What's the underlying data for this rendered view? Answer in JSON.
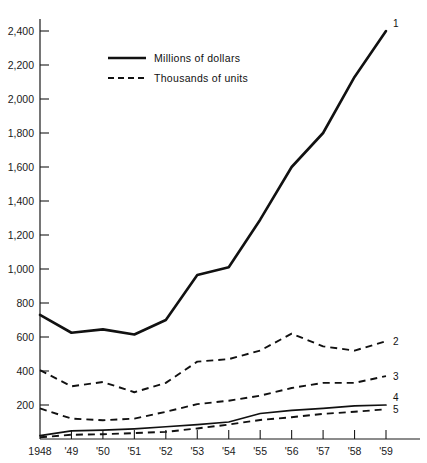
{
  "chart_data": {
    "type": "line",
    "title": "",
    "subtitle": "",
    "xlabel": "",
    "ylabel": "",
    "grid": false,
    "legend_position": "upper-left-inside",
    "xlim": [
      1948,
      1959
    ],
    "ylim": [
      0,
      2400
    ],
    "ytick_step": 200,
    "categories": [
      "1948",
      "'49",
      "'50",
      "'51",
      "'52",
      "'53",
      "'54",
      "'55",
      "'56",
      "'57",
      "'58",
      "'59"
    ],
    "x": [
      1948,
      1949,
      1950,
      1951,
      1952,
      1953,
      1954,
      1955,
      1956,
      1957,
      1958,
      1959
    ],
    "ytick_labels": [
      "200",
      "400",
      "600",
      "800",
      "1,000",
      "1,200",
      "1,400",
      "1,600",
      "1,800",
      "2,000",
      "2,200",
      "2,400"
    ],
    "ytick_values": [
      200,
      400,
      600,
      800,
      1000,
      1200,
      1400,
      1600,
      1800,
      2000,
      2200,
      2400
    ],
    "legend": [
      {
        "label": "Millions of dollars",
        "style": "solid"
      },
      {
        "label": "Thousands of units",
        "style": "dashed"
      }
    ],
    "series": [
      {
        "name": "1",
        "end_label": "1",
        "style": "solid",
        "unit": "Millions of dollars",
        "values": [
          730,
          625,
          645,
          615,
          700,
          965,
          1010,
          1290,
          1600,
          1800,
          2130,
          2400
        ]
      },
      {
        "name": "2",
        "end_label": "2",
        "style": "dashed",
        "unit": "Thousands of units",
        "values": [
          405,
          310,
          335,
          275,
          330,
          455,
          470,
          520,
          620,
          545,
          520,
          575
        ]
      },
      {
        "name": "3",
        "end_label": "3",
        "style": "dashed",
        "unit": "Thousands of units",
        "values": [
          180,
          120,
          110,
          120,
          160,
          205,
          225,
          255,
          300,
          330,
          330,
          370
        ]
      },
      {
        "name": "4",
        "end_label": "4",
        "style": "solid",
        "unit": "Millions of dollars",
        "values": [
          20,
          48,
          52,
          60,
          72,
          85,
          100,
          150,
          168,
          180,
          195,
          200
        ]
      },
      {
        "name": "5",
        "end_label": "5",
        "style": "dashed",
        "unit": "Thousands of units",
        "values": [
          10,
          25,
          28,
          35,
          42,
          62,
          85,
          112,
          128,
          148,
          160,
          175
        ]
      }
    ],
    "axis_color": "#1a1a1a",
    "series_color": "#111111",
    "background_color": "#ffffff"
  },
  "footnote": {
    "text": "1.  Data then reading ... clipped"
  }
}
